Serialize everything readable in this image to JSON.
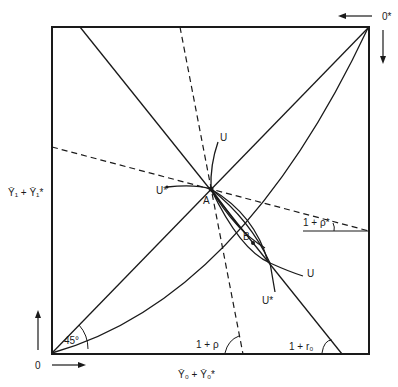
{
  "diagram": {
    "type": "edgeworth-box",
    "origin_label": "0",
    "origin_star_label": "0*",
    "x_axis_label": "Ȳ₀ + Ȳ₀*",
    "y_axis_label": "Ȳ₁ + Ȳ₁*",
    "angle_45_label": "45°",
    "rho_label": "1 + ρ",
    "rho_star_label": "1 + ρ*",
    "r0_label": "1 + r₀",
    "point_a_label": "A",
    "point_b_label": "B",
    "u_label_top": "U",
    "u_star_label_left": "U*",
    "u_label_right": "U",
    "u_star_label_bottom": "U*"
  }
}
